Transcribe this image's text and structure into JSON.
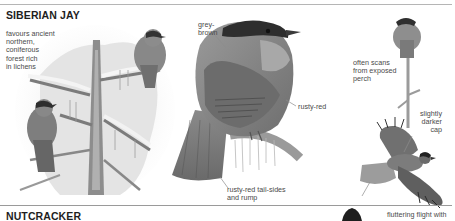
{
  "page": {
    "sections": [
      {
        "title": "SIBERIAN JAY",
        "captions": {
          "habitat": "favours ancient\nnorthern,\nconiferous\nforest rich\nin lichens",
          "head": "grey-\nbrown",
          "flank": "rusty-red",
          "tail": "rusty-red tail-sides\nand rump",
          "perch": "often scans\nfrom exposed\nperch",
          "cap": "slightly\ndarker\ncap"
        }
      },
      {
        "title": "NUTCRACKER",
        "captions": {
          "flight": "fluttering flight with"
        }
      }
    ],
    "illustrations": [
      "siberian-jay-pair-in-snowy-conifer",
      "siberian-jay-perched-large",
      "siberian-jay-on-exposed-perch",
      "siberian-jay-in-flight",
      "nutcracker-partial"
    ]
  }
}
